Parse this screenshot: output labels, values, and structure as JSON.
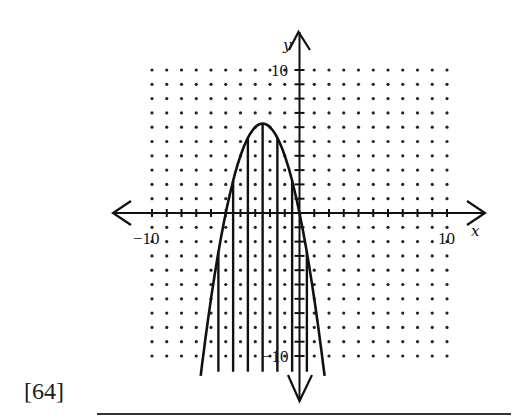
{
  "question": {
    "number_label": "[64]"
  },
  "chart_data": {
    "type": "line",
    "title": "",
    "xlabel": "x",
    "ylabel": "y",
    "xlim": [
      -10,
      10
    ],
    "ylim": [
      -10,
      10
    ],
    "grid": "dots",
    "tick_labels": {
      "x": [
        "-10",
        "10"
      ],
      "y": [
        "10",
        "-10"
      ]
    },
    "series": [
      {
        "name": "parabola",
        "equation": "y = -x^2 - 5x",
        "vertex": [
          -2.5,
          6.25
        ],
        "x_intercepts": [
          -5,
          0
        ],
        "x": [
          -6.7,
          -6,
          -5,
          -4,
          -3,
          -2.5,
          -2,
          -1,
          0,
          1,
          1.7
        ],
        "y": [
          -11.4,
          -6,
          0,
          4,
          6,
          6.25,
          6,
          4,
          0,
          -6,
          -11.4
        ]
      }
    ],
    "shading": {
      "style": "vertical-lines",
      "region": "y <= -x^2 - 5x",
      "line_x": [
        -5.5,
        -4.5,
        -3.5,
        -2.5,
        -1.5,
        -0.5,
        0.5
      ],
      "bottom_y": -11.1
    },
    "legend": null
  },
  "labels": {
    "x_axis": "x",
    "y_axis": "y",
    "x_min": "−10",
    "x_max": "10",
    "y_max": "10",
    "y_min": "−10"
  }
}
